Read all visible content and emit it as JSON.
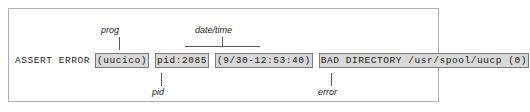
{
  "figure": {
    "log_line": {
      "segments": [
        {
          "name": "prefix",
          "text": "ASSERT ERROR",
          "highlighted": false
        },
        {
          "name": "prog",
          "text": "(uucico)",
          "highlighted": true
        },
        {
          "name": "pid",
          "text": "pid:2085",
          "highlighted": true
        },
        {
          "name": "datetime",
          "text": "(9/30-12:53:40)",
          "highlighted": true
        },
        {
          "name": "error",
          "text": "BAD DIRECTORY /usr/spool/uucp (0)",
          "highlighted": true
        }
      ]
    },
    "annotations": [
      {
        "name": "prog",
        "label": "prog",
        "position": "above"
      },
      {
        "name": "datetime",
        "label": "date/time",
        "position": "above"
      },
      {
        "name": "pid",
        "label": "pid",
        "position": "below"
      },
      {
        "name": "error",
        "label": "error",
        "position": "below"
      }
    ],
    "colors": {
      "frame_border": "#b0b0b0",
      "segment_fill": "#d9d9d9",
      "segment_border": "#7a7a7a",
      "leader_line": "#5a5a5a",
      "text": "#1a1a1a",
      "background": "#ffffff"
    }
  }
}
